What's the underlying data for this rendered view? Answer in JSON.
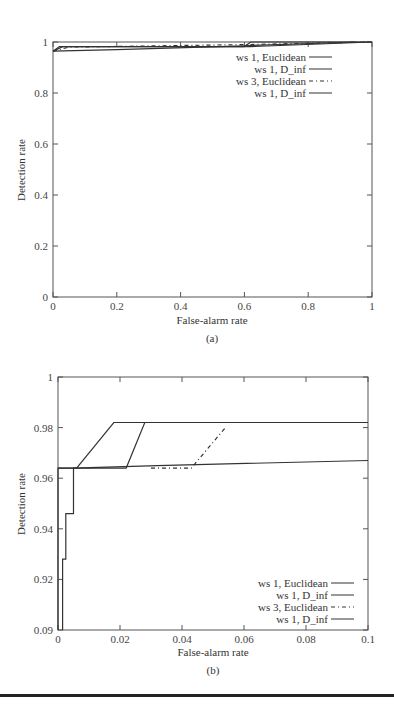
{
  "chart_data": [
    {
      "type": "line",
      "panel": "(a)",
      "xlabel": "False-alarm rate",
      "ylabel": "Detection rate",
      "xlim": [
        0,
        1
      ],
      "ylim": [
        0,
        1
      ],
      "xticks": [
        "0",
        "0.2",
        "0.4",
        "0.6",
        "0.8",
        "1"
      ],
      "yticks": [
        "0",
        "0.2",
        "0.4",
        "0.6",
        "0.8",
        "1"
      ],
      "legend": [
        "ws 1, Euclidean",
        "ws 1, D_inf",
        "ws 3, Euclidean",
        "ws 1, D_inf"
      ],
      "legend_position": "upper right",
      "series": [
        {
          "name": "ws 1, Euclidean",
          "x": [
            0,
            0.02,
            0.6,
            0.62,
            1.0
          ],
          "y": [
            0.964,
            0.982,
            0.982,
            1.0,
            1.0
          ]
        },
        {
          "name": "ws 1, D_inf",
          "x": [
            0,
            0.03,
            0.62,
            1.0
          ],
          "y": [
            0.964,
            0.982,
            0.982,
            1.0
          ]
        },
        {
          "name": "ws 3, Euclidean",
          "x": [
            0,
            0.05,
            0.6,
            1.0
          ],
          "y": [
            0.964,
            0.98,
            0.99,
            1.0
          ]
        },
        {
          "name": "ws 1, D_inf",
          "x": [
            0,
            0.2,
            0.6,
            0.95
          ],
          "y": [
            0.964,
            0.97,
            0.985,
            1.0
          ]
        }
      ]
    },
    {
      "type": "line",
      "panel": "(b)",
      "xlabel": "False-alarm rate",
      "ylabel": "Detection rate",
      "xlim": [
        0,
        0.1
      ],
      "ylim": [
        0.9,
        1
      ],
      "xticks": [
        "0",
        "0.02",
        "0.04",
        "0.06",
        "0.08",
        "0.1"
      ],
      "yticks": [
        "0.09",
        "0.92",
        "0.94",
        "0.96",
        "0.98",
        "1"
      ],
      "legend": [
        "ws 1, Euclidean",
        "ws 1, D_inf",
        "ws 3, Euclidean",
        "ws 1, D_inf"
      ],
      "legend_position": "lower right",
      "series": [
        {
          "name": "ws 1, Euclidean",
          "x": [
            0.0,
            0.0,
            0.006,
            0.018,
            0.1
          ],
          "y": [
            0.9,
            0.964,
            0.964,
            0.982,
            0.982
          ]
        },
        {
          "name": "ws 1, D_inf",
          "x": [
            0.0,
            0.022,
            0.028,
            0.1
          ],
          "y": [
            0.964,
            0.964,
            0.982,
            0.982
          ]
        },
        {
          "name": "ws 3, Euclidean",
          "x": [
            0.03,
            0.043,
            0.054
          ],
          "y": [
            0.964,
            0.964,
            0.98
          ]
        },
        {
          "name": "ws 1, D_inf",
          "x": [
            0.0015,
            0.0015,
            0.0025,
            0.0025,
            0.005,
            0.005,
            0.032,
            0.1
          ],
          "y": [
            0.9,
            0.928,
            0.928,
            0.946,
            0.946,
            0.964,
            0.965,
            0.967
          ]
        }
      ]
    }
  ],
  "figure": {
    "panel_a_caption": "(a)",
    "panel_b_caption": "(b)"
  }
}
